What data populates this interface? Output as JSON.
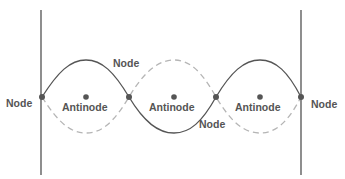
{
  "diagram": {
    "colors": {
      "boundary": "#444444",
      "solid_wave": "#555555",
      "dashed_wave": "#b5b5b5",
      "dot": "#555555",
      "text": "#555555"
    },
    "labels": {
      "node_left": "Node",
      "node_top": "Node",
      "node_bottom": "Node",
      "node_right": "Node",
      "antinode_1": "Antinode",
      "antinode_2": "Antinode",
      "antinode_3": "Antinode"
    },
    "nodes": [
      {
        "x": 42,
        "y": 97
      },
      {
        "x": 129,
        "y": 97
      },
      {
        "x": 216,
        "y": 97
      },
      {
        "x": 301,
        "y": 97
      }
    ],
    "antinodes": [
      {
        "x": 86,
        "y": 97
      },
      {
        "x": 174,
        "y": 97
      },
      {
        "x": 260,
        "y": 97
      }
    ],
    "boundaries": [
      {
        "x": 41,
        "y1": 10,
        "y2": 175
      },
      {
        "x": 301,
        "y1": 10,
        "y2": 175
      }
    ],
    "legend": {
      "solid": "wave at one instant",
      "dashed": "wave half a period later"
    }
  }
}
